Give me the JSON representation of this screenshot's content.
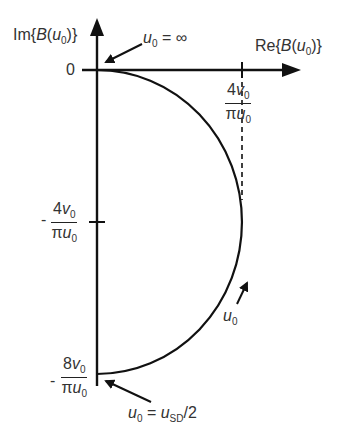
{
  "diagram": {
    "type": "complex-plane-plot",
    "axes": {
      "y_label": {
        "prefix": "Im{",
        "fn": "B",
        "open": "(",
        "var": "u",
        "sub": "0",
        "close": ")}"
      },
      "x_label": {
        "prefix": "Re{",
        "fn": "B",
        "open": "(",
        "var": "u",
        "sub": "0",
        "close": ")}"
      }
    },
    "ticks": {
      "origin": "0",
      "x_tick": {
        "num_coef": "4",
        "num_var": "v",
        "num_sub": "0",
        "den_pi": "π",
        "den_var": "u",
        "den_sub": "0"
      },
      "y_tick_mid": {
        "sign": "-",
        "num_coef": "4",
        "num_var": "v",
        "num_sub": "0",
        "den_pi": "π",
        "den_var": "u",
        "den_sub": "0"
      },
      "y_tick_bottom": {
        "sign": "-",
        "num_coef": "8",
        "num_var": "v",
        "num_sub": "0",
        "den_pi": "π",
        "den_var": "u",
        "den_sub": "0"
      }
    },
    "annotations": {
      "top": {
        "var": "u",
        "sub": "0",
        "eq": " = ∞"
      },
      "direction": {
        "var": "u",
        "sub": "0"
      },
      "bottom": {
        "var": "u",
        "sub": "0",
        "eq": " = ",
        "var2": "u",
        "sub2": "SD",
        "tail": "/2"
      }
    },
    "curve": "semicircle from origin (u0=∞) to -8v0/(πu0) (u0=uSD/2), max Re = 4v0/(πu0) at Im = -4v0/(πu0)",
    "colors": {
      "line": "#111111",
      "text": "#333333",
      "background": "#ffffff"
    }
  }
}
